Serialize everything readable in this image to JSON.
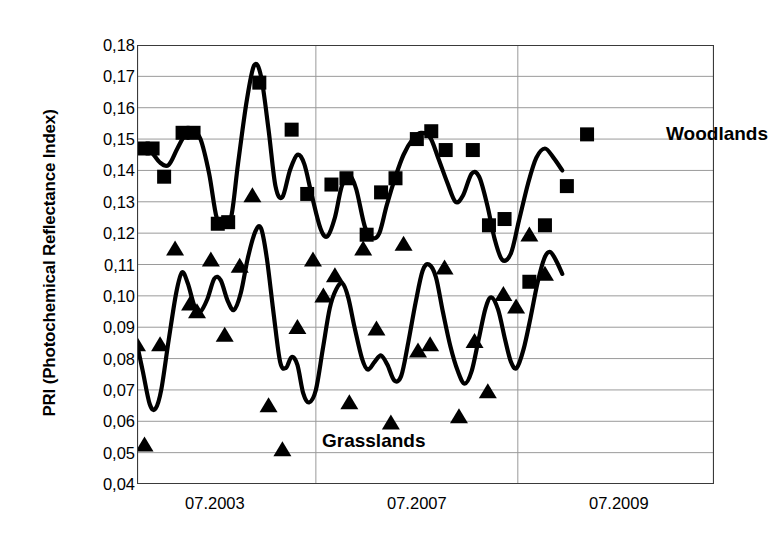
{
  "chart_data": {
    "type": "scatter",
    "title": "",
    "xlabel": "",
    "ylabel": "PRI (Photochemical Reflectance Index)",
    "ylim": [
      0.04,
      0.18
    ],
    "ytick_labels": [
      "0,18",
      "0,17",
      "0,16",
      "0,15",
      "0,14",
      "0,13",
      "0,12",
      "0,11",
      "0,10",
      "0,09",
      "0,08",
      "0,07",
      "0,06",
      "0,05",
      "0,04"
    ],
    "ytick_values": [
      0.18,
      0.17,
      0.16,
      0.15,
      0.14,
      0.13,
      0.12,
      0.11,
      0.1,
      0.09,
      0.08,
      0.07,
      0.06,
      0.05,
      0.04
    ],
    "xtick_labels": [
      "07.2003",
      "07.2007",
      "07.2009"
    ],
    "xtick_positions": [
      0.135,
      0.485,
      0.835
    ],
    "minor_xtick_positions": [
      0.135,
      0.31,
      0.485,
      0.66,
      0.835
    ],
    "gridline_xpositions": [
      0.31,
      0.66
    ],
    "grid": true,
    "legend_position": "inside-annotations",
    "annotations": [
      {
        "id": "woodlands",
        "text": "Woodlands"
      },
      {
        "id": "grasslands",
        "text": "Grasslands"
      }
    ],
    "series": [
      {
        "name": "Woodlands",
        "marker": "square",
        "color": "#000000",
        "x": [
          0.01,
          0.027,
          0.047,
          0.079,
          0.098,
          0.14,
          0.158,
          0.212,
          0.268,
          0.295,
          0.337,
          0.363,
          0.398,
          0.423,
          0.448,
          0.485,
          0.51,
          0.535,
          0.582,
          0.61,
          0.637,
          0.68,
          0.707,
          0.745,
          0.78
        ],
        "values": [
          0.147,
          0.147,
          0.138,
          0.152,
          0.152,
          0.123,
          0.1235,
          0.168,
          0.153,
          0.1325,
          0.1355,
          0.1375,
          0.1195,
          0.133,
          0.1375,
          0.15,
          0.1525,
          0.1465,
          0.1465,
          0.1225,
          0.1245,
          0.1045,
          0.1225,
          0.135,
          0.1515
        ],
        "line": true
      },
      {
        "name": "Grasslands",
        "marker": "triangle",
        "color": "#000000",
        "x": [
          0.0,
          0.013,
          0.04,
          0.066,
          0.092,
          0.104,
          0.128,
          0.152,
          0.178,
          0.2,
          0.228,
          0.252,
          0.278,
          0.305,
          0.323,
          0.343,
          0.368,
          0.392,
          0.415,
          0.44,
          0.462,
          0.487,
          0.508,
          0.533,
          0.558,
          0.585,
          0.608,
          0.635,
          0.657,
          0.68,
          0.707
        ],
        "values": [
          0.0845,
          0.0525,
          0.0845,
          0.115,
          0.0975,
          0.095,
          0.1115,
          0.0875,
          0.1095,
          0.132,
          0.065,
          0.051,
          0.09,
          0.1115,
          0.1,
          0.1065,
          0.066,
          0.115,
          0.0895,
          0.0595,
          0.1165,
          0.0825,
          0.0845,
          0.109,
          0.0615,
          0.0855,
          0.0695,
          0.1005,
          0.0965,
          0.1195,
          0.107
        ],
        "line": true
      }
    ],
    "woodlands_curve": [
      [
        0.0,
        0.147
      ],
      [
        0.02,
        0.1468
      ],
      [
        0.04,
        0.1425
      ],
      [
        0.055,
        0.1418
      ],
      [
        0.07,
        0.147
      ],
      [
        0.085,
        0.1518
      ],
      [
        0.098,
        0.152
      ],
      [
        0.11,
        0.15
      ],
      [
        0.125,
        0.139
      ],
      [
        0.138,
        0.125
      ],
      [
        0.15,
        0.124
      ],
      [
        0.163,
        0.125
      ],
      [
        0.175,
        0.142
      ],
      [
        0.19,
        0.162
      ],
      [
        0.203,
        0.1735
      ],
      [
        0.215,
        0.17
      ],
      [
        0.228,
        0.153
      ],
      [
        0.24,
        0.135
      ],
      [
        0.252,
        0.1315
      ],
      [
        0.265,
        0.14
      ],
      [
        0.278,
        0.145
      ],
      [
        0.29,
        0.142
      ],
      [
        0.303,
        0.132
      ],
      [
        0.318,
        0.1215
      ],
      [
        0.33,
        0.119
      ],
      [
        0.343,
        0.125
      ],
      [
        0.355,
        0.135
      ],
      [
        0.368,
        0.1385
      ],
      [
        0.38,
        0.134
      ],
      [
        0.395,
        0.122
      ],
      [
        0.408,
        0.1185
      ],
      [
        0.42,
        0.12
      ],
      [
        0.433,
        0.129
      ],
      [
        0.448,
        0.138
      ],
      [
        0.462,
        0.145
      ],
      [
        0.478,
        0.15
      ],
      [
        0.492,
        0.152
      ],
      [
        0.508,
        0.1505
      ],
      [
        0.522,
        0.144
      ],
      [
        0.538,
        0.136
      ],
      [
        0.552,
        0.13
      ],
      [
        0.565,
        0.132
      ],
      [
        0.58,
        0.139
      ],
      [
        0.593,
        0.138
      ],
      [
        0.607,
        0.129
      ],
      [
        0.62,
        0.118
      ],
      [
        0.633,
        0.1115
      ],
      [
        0.648,
        0.1135
      ],
      [
        0.662,
        0.124
      ],
      [
        0.678,
        0.136
      ],
      [
        0.692,
        0.144
      ],
      [
        0.707,
        0.147
      ],
      [
        0.722,
        0.144
      ],
      [
        0.737,
        0.14
      ]
    ],
    "grasslands_curve": [
      [
        0.0,
        0.0845
      ],
      [
        0.01,
        0.076
      ],
      [
        0.022,
        0.0655
      ],
      [
        0.032,
        0.064
      ],
      [
        0.042,
        0.07
      ],
      [
        0.055,
        0.086
      ],
      [
        0.068,
        0.101
      ],
      [
        0.078,
        0.1075
      ],
      [
        0.088,
        0.104
      ],
      [
        0.1,
        0.0965
      ],
      [
        0.11,
        0.095
      ],
      [
        0.122,
        0.099
      ],
      [
        0.134,
        0.1055
      ],
      [
        0.145,
        0.105
      ],
      [
        0.157,
        0.0985
      ],
      [
        0.168,
        0.0955
      ],
      [
        0.18,
        0.101
      ],
      [
        0.192,
        0.112
      ],
      [
        0.205,
        0.1205
      ],
      [
        0.215,
        0.1215
      ],
      [
        0.225,
        0.112
      ],
      [
        0.237,
        0.094
      ],
      [
        0.248,
        0.079
      ],
      [
        0.258,
        0.077
      ],
      [
        0.268,
        0.0805
      ],
      [
        0.278,
        0.078
      ],
      [
        0.288,
        0.069
      ],
      [
        0.298,
        0.066
      ],
      [
        0.31,
        0.07
      ],
      [
        0.322,
        0.083
      ],
      [
        0.334,
        0.096
      ],
      [
        0.345,
        0.102
      ],
      [
        0.356,
        0.104
      ],
      [
        0.366,
        0.0995
      ],
      [
        0.377,
        0.09
      ],
      [
        0.39,
        0.08
      ],
      [
        0.4,
        0.0765
      ],
      [
        0.412,
        0.079
      ],
      [
        0.423,
        0.081
      ],
      [
        0.434,
        0.078
      ],
      [
        0.446,
        0.073
      ],
      [
        0.458,
        0.0745
      ],
      [
        0.47,
        0.085
      ],
      [
        0.483,
        0.098
      ],
      [
        0.495,
        0.108
      ],
      [
        0.506,
        0.11
      ],
      [
        0.518,
        0.106
      ],
      [
        0.53,
        0.095
      ],
      [
        0.543,
        0.084
      ],
      [
        0.556,
        0.076
      ],
      [
        0.568,
        0.072
      ],
      [
        0.58,
        0.076
      ],
      [
        0.592,
        0.086
      ],
      [
        0.604,
        0.096
      ],
      [
        0.614,
        0.0995
      ],
      [
        0.626,
        0.0955
      ],
      [
        0.638,
        0.086
      ],
      [
        0.648,
        0.079
      ],
      [
        0.658,
        0.077
      ],
      [
        0.67,
        0.083
      ],
      [
        0.682,
        0.093
      ],
      [
        0.694,
        0.104
      ],
      [
        0.706,
        0.112
      ],
      [
        0.716,
        0.114
      ],
      [
        0.727,
        0.111
      ],
      [
        0.737,
        0.107
      ]
    ]
  }
}
